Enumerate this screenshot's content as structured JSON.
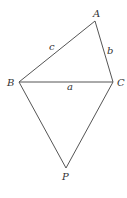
{
  "diagram": {
    "type": "geometry",
    "colors": {
      "line": "#555555",
      "text": "#333333",
      "background": "#ffffff"
    },
    "vertices": [
      {
        "id": "A",
        "label": "A",
        "x": 95,
        "y": 21,
        "label_x": 93,
        "label_y": 17
      },
      {
        "id": "B",
        "label": "B",
        "x": 19,
        "y": 82,
        "label_x": 7,
        "label_y": 86
      },
      {
        "id": "C",
        "label": "C",
        "x": 113,
        "y": 82,
        "label_x": 117,
        "label_y": 86
      },
      {
        "id": "P",
        "label": "P",
        "x": 66,
        "y": 168,
        "label_x": 62,
        "label_y": 180
      }
    ],
    "edges": [
      {
        "from": "B",
        "to": "A",
        "label": "c",
        "label_x": 49,
        "label_y": 50
      },
      {
        "from": "A",
        "to": "C",
        "label": "b",
        "label_x": 107,
        "label_y": 54
      },
      {
        "from": "B",
        "to": "C",
        "label": "a",
        "label_x": 67,
        "label_y": 90
      },
      {
        "from": "B",
        "to": "P",
        "label": ""
      },
      {
        "from": "C",
        "to": "P",
        "label": ""
      }
    ]
  }
}
